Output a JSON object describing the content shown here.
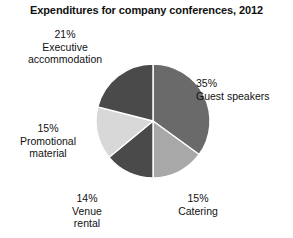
{
  "chart_data": {
    "type": "pie",
    "title": "Expenditures for company conferences, 2012",
    "xlabel": "",
    "ylabel": "",
    "legend": "none",
    "grid": false,
    "categories": [
      "Guest speakers",
      "Catering",
      "Venue rental",
      "Promotional material",
      "Executive accommodation"
    ],
    "values": [
      35,
      15,
      14,
      15,
      21
    ],
    "value_unit": "%",
    "start_angle_deg": 0,
    "direction": "clockwise",
    "slices": [
      {
        "name": "Guest speakers",
        "value": 35,
        "value_text": "35%",
        "color": "#6a6a6a",
        "start_deg": 0,
        "end_deg": 126
      },
      {
        "name": "Catering",
        "value": 15,
        "value_text": "15%",
        "color": "#a8a8a8",
        "start_deg": 126,
        "end_deg": 180
      },
      {
        "name": "Venue rental",
        "value": 14,
        "value_text": "14%",
        "color": "#4a4a4a",
        "start_deg": 180,
        "end_deg": 230.4
      },
      {
        "name": "Promotional material",
        "value": 15,
        "value_text": "15%",
        "color": "#d8d8d8",
        "start_deg": 230.4,
        "end_deg": 284.4
      },
      {
        "name": "Executive accommodation",
        "value": 21,
        "value_text": "21%",
        "color": "#4a4a4a",
        "start_deg": 284.4,
        "end_deg": 360
      }
    ]
  },
  "labels": {
    "executive_accommodation": {
      "pct": "21%",
      "line1": "Executive",
      "line2": "accommodation"
    },
    "guest_speakers": {
      "pct": "35%",
      "line1": "Guest speakers",
      "line2": ""
    },
    "promotional_material": {
      "pct": "15%",
      "line1": "Promotional",
      "line2": "material"
    },
    "venue_rental": {
      "pct": "14%",
      "line1": "Venue",
      "line2": "rental"
    },
    "catering": {
      "pct": "15%",
      "line1": "Catering",
      "line2": ""
    }
  },
  "geometry": {
    "center_x": 153,
    "center_y": 121,
    "radius": 57,
    "divider_color": "#ffffff"
  },
  "colors": {
    "background": "#ffffff",
    "text": "#111111",
    "guest_speakers": "#6a6a6a",
    "catering": "#a8a8a8",
    "venue_rental": "#4a4a4a",
    "promotional_material": "#d8d8d8",
    "executive_accommodation": "#4a4a4a"
  }
}
